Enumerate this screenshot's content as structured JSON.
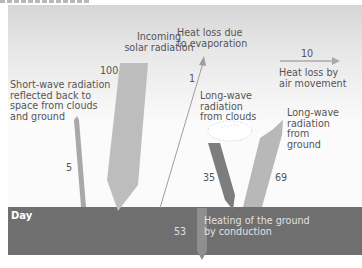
{
  "figure": {
    "caption_visible": "",
    "ground_label": "Day"
  },
  "flows": [
    {
      "id": "incoming_solar",
      "label": "Incoming\nsolar radiation",
      "value": "100",
      "color": "#bdbdbd"
    },
    {
      "id": "short_wave_reflected",
      "label": "Short-wave radiation\nreflected back to\nspace from clouds\nand ground",
      "value": "5",
      "color": "#a8a8a8"
    },
    {
      "id": "evaporation",
      "label": "Heat loss due\nto evaporation",
      "value": "1",
      "color": "#9e9e9e"
    },
    {
      "id": "air_movement",
      "label": "Heat loss by\nair movement",
      "value": "10",
      "color": "#aaaaaa"
    },
    {
      "id": "longwave_clouds",
      "label": "Long-wave\nradiation\nfrom clouds",
      "value": "35",
      "color": "#7d7d7d"
    },
    {
      "id": "longwave_ground",
      "label": "Long-wave\nradiation\nfrom\nground",
      "value": "69",
      "color": "#b8b8b8"
    },
    {
      "id": "conduction",
      "label": "Heating of the ground\nby conduction",
      "value": "53",
      "color": "#8f8f8f"
    }
  ],
  "colors": {
    "ground": "#6f6f6f",
    "sky_top": "#d6d6d6",
    "sky_bottom": "#fbfbfb",
    "text": "#555555"
  }
}
